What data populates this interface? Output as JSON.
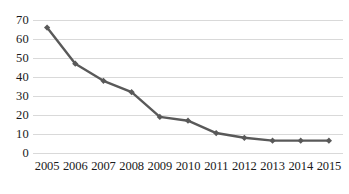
{
  "chart_data": {
    "type": "line",
    "title": "",
    "subtitle": "",
    "xlabel": "",
    "ylabel": "",
    "categories": [
      "2005",
      "2006",
      "2007",
      "2008",
      "2009",
      "2010",
      "2011",
      "2012",
      "2013",
      "2014",
      "2015"
    ],
    "series": [
      {
        "name": "",
        "values": [
          66,
          47,
          38,
          32,
          19,
          17,
          10.5,
          8,
          6.5,
          6.5,
          6.5
        ]
      }
    ],
    "ylim": [
      0,
      70
    ],
    "y_ticks": [
      0,
      10,
      20,
      30,
      40,
      50,
      60,
      70
    ],
    "y_tick_labels": [
      "0",
      "10",
      "20",
      "30",
      "40",
      "50",
      "60",
      "70"
    ],
    "grid": "horizontal",
    "legend": "none",
    "marker": "diamond",
    "colors": {
      "line": "#595959",
      "marker": "#595959",
      "gridline": "#d9d9d9",
      "text": "#1a1a1a",
      "background": "#ffffff"
    }
  }
}
